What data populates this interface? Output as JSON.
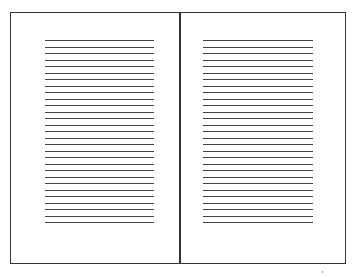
{
  "diagram": {
    "pages": [
      {
        "id": "left",
        "line_count": 29,
        "lines_left": 34,
        "lines_width": 109,
        "first_line_top": 27,
        "line_spacing": 6.5
      },
      {
        "id": "right",
        "line_count": 29,
        "lines_left": 22,
        "lines_width": 110,
        "first_line_top": 27,
        "line_spacing": 6.5
      }
    ],
    "colors": {
      "border": "#333333",
      "line": "#444444",
      "background": "#ffffff"
    }
  }
}
